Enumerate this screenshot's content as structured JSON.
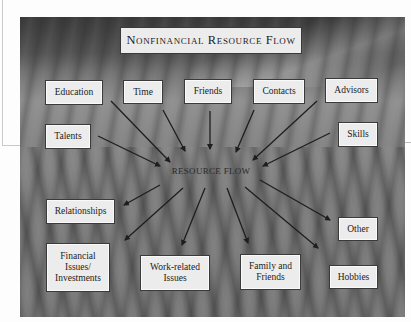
{
  "diagram": {
    "title": "Nonfinancial Resource Flow",
    "center_label": "RESOURCE FLOW",
    "inputs": [
      {
        "id": "education",
        "label": "Education"
      },
      {
        "id": "time",
        "label": "Time"
      },
      {
        "id": "friends",
        "label": "Friends"
      },
      {
        "id": "contacts",
        "label": "Contacts"
      },
      {
        "id": "advisors",
        "label": "Advisors"
      },
      {
        "id": "talents",
        "label": "Talents"
      },
      {
        "id": "skills",
        "label": "Skills"
      }
    ],
    "outputs": [
      {
        "id": "relationships",
        "label": "Relationships"
      },
      {
        "id": "financial",
        "label": "Financial\nIssues/\nInvestments"
      },
      {
        "id": "work",
        "label": "Work-related\nIssues"
      },
      {
        "id": "family",
        "label": "Family and\nFriends"
      },
      {
        "id": "hobbies",
        "label": "Hobbies"
      },
      {
        "id": "other",
        "label": "Other"
      }
    ],
    "edges": [
      {
        "from": "education",
        "to": "resource-flow"
      },
      {
        "from": "time",
        "to": "resource-flow"
      },
      {
        "from": "friends",
        "to": "resource-flow"
      },
      {
        "from": "contacts",
        "to": "resource-flow"
      },
      {
        "from": "advisors",
        "to": "resource-flow"
      },
      {
        "from": "talents",
        "to": "resource-flow"
      },
      {
        "from": "skills",
        "to": "resource-flow"
      },
      {
        "from": "resource-flow",
        "to": "relationships"
      },
      {
        "from": "resource-flow",
        "to": "financial"
      },
      {
        "from": "resource-flow",
        "to": "work"
      },
      {
        "from": "resource-flow",
        "to": "family"
      },
      {
        "from": "resource-flow",
        "to": "hobbies"
      },
      {
        "from": "resource-flow",
        "to": "other"
      }
    ]
  },
  "colors": {
    "box_fill": "#ececec",
    "box_border": "#3a3a3a",
    "arrow": "#1e1e1e",
    "text": "#222222"
  }
}
